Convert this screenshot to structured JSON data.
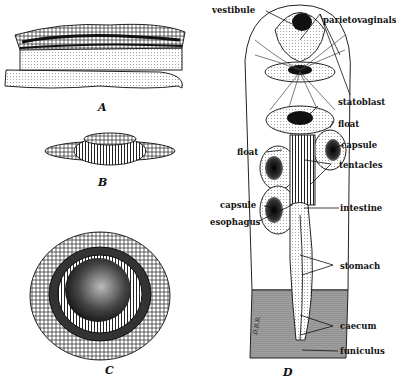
{
  "figures": {
    "A": {
      "caption": "A"
    },
    "B": {
      "caption": "B"
    },
    "C": {
      "caption": "C"
    },
    "D": {
      "caption": "D",
      "signature": "D.B.R."
    }
  },
  "labels": {
    "vestibule": "vestibule",
    "parietovaginals": "parietovaginals",
    "statoblast": "statoblast",
    "float_right": "float",
    "float_left": "float",
    "capsule_right": "capsule",
    "capsule_left": "capsule",
    "tentacles": "tentacles",
    "esophagus": "esophagus",
    "intestine": "intestine",
    "stomach": "stomach",
    "caecum": "caecum",
    "funiculus": "funiculus"
  },
  "colors": {
    "ink": "#111111",
    "paper": "#ffffff"
  }
}
